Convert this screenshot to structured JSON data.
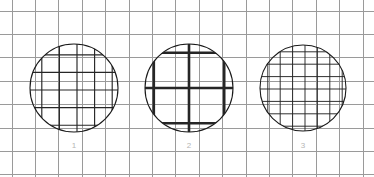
{
  "figure": {
    "width": 374,
    "height": 177,
    "background_color": "#ffffff"
  },
  "background_grid": {
    "name": "background-grid",
    "line_color": "#9a9a9a",
    "line_width": 1,
    "cell_size": 23.4,
    "x_origin": 12,
    "y_origin": 11,
    "columns": 14,
    "rows": 6,
    "x_lines": [
      12,
      35.4,
      58.8,
      82.2,
      105.6,
      129,
      152.4,
      175.8,
      199.2,
      222.6,
      246,
      269.4,
      292.8,
      316.2,
      339.6,
      363
    ],
    "y_lines": [
      11,
      34.4,
      57.8,
      81.2,
      104.6,
      128,
      151.4,
      174.8
    ]
  },
  "samples": [
    {
      "label": "1",
      "name": "mesh-sample-1",
      "center_x": 74,
      "center_y": 88,
      "radius": 44,
      "outline_color": "#1a1a1a",
      "outline_width": 1.1,
      "mesh_color": "#262626",
      "mesh_line_width": 1.15,
      "mesh_spacing": 17.6,
      "mesh_offset_x": 3,
      "mesh_offset_y": 2,
      "mesh_density": "fine",
      "label_x": 74,
      "label_y": 148,
      "label_color": "#b5b5b5"
    },
    {
      "label": "2",
      "name": "mesh-sample-2",
      "center_x": 189,
      "center_y": 88,
      "radius": 44,
      "outline_color": "#1a1a1a",
      "outline_width": 1.1,
      "mesh_color": "#262626",
      "mesh_line_width": 2.6,
      "mesh_spacing": 35.2,
      "mesh_offset_x": 0,
      "mesh_offset_y": 0,
      "mesh_density": "coarse",
      "label_x": 189,
      "label_y": 148,
      "label_color": "#b5b5b5"
    },
    {
      "label": "3",
      "name": "mesh-sample-3",
      "center_x": 303,
      "center_y": 88,
      "radius": 43,
      "outline_color": "#1a1a1a",
      "outline_width": 1.1,
      "mesh_color": "#262626",
      "mesh_line_width": 0.95,
      "mesh_spacing": 12.4,
      "mesh_offset_x": 2,
      "mesh_offset_y": 1,
      "mesh_density": "very-fine",
      "label_x": 303,
      "label_y": 148,
      "label_color": "#b5b5b5"
    }
  ]
}
